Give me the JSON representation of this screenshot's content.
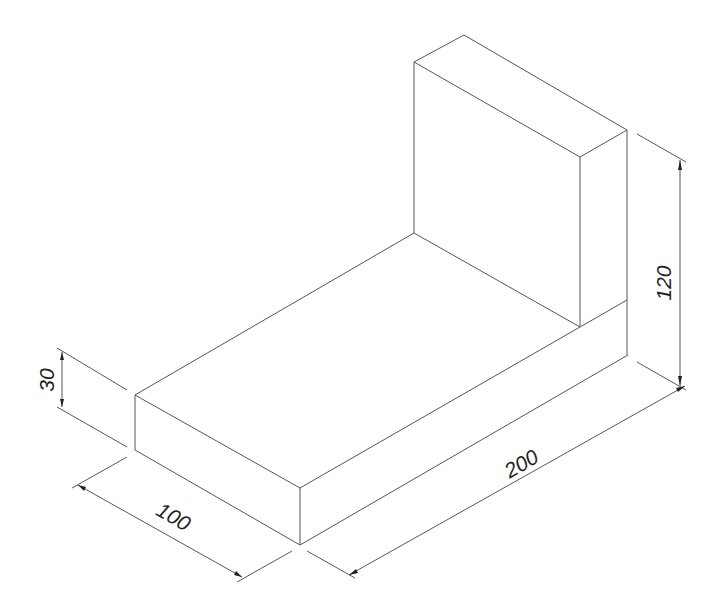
{
  "drawing": {
    "type": "isometric-view",
    "subject": "L-shaped block",
    "line_color": "#555555",
    "background": "#ffffff"
  },
  "dimensions": {
    "height_total": {
      "label": "120",
      "axis": "vertical"
    },
    "base_thickness": {
      "label": "30",
      "axis": "vertical"
    },
    "width": {
      "label": "100",
      "axis": "depth"
    },
    "length": {
      "label": "200",
      "axis": "length"
    }
  }
}
